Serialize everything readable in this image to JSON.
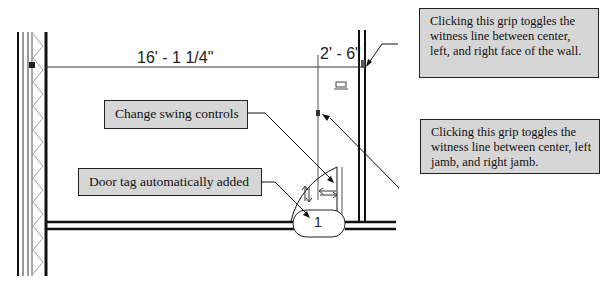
{
  "dimensions": {
    "main": "16' - 1 1/4\"",
    "door_offset": "2' - 6\""
  },
  "door_tag": {
    "number": "1"
  },
  "callouts": {
    "swing": "Change swing controls",
    "tag": "Door tag automatically added",
    "wall_grip": "Clicking this grip toggles the witness line between center, left, and right face of the wall.",
    "jamb_grip": "Clicking this grip toggles the witness line between center, left jamb, and right jamb."
  },
  "colors": {
    "callout_fill": "#d6d6d6",
    "line": "#111111"
  }
}
